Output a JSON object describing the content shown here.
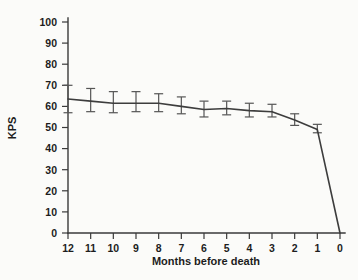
{
  "chart_data": {
    "type": "line",
    "title": "",
    "xlabel": "Months before death",
    "ylabel": "KPS",
    "xlim": [
      12,
      0
    ],
    "ylim": [
      0,
      100
    ],
    "grid": false,
    "legend": "none",
    "x_invert": true,
    "x_tick_labels": [
      "12",
      "11",
      "10",
      "9",
      "8",
      "7",
      "6",
      "5",
      "4",
      "3",
      "2",
      "1",
      "0"
    ],
    "y_tick_labels": [
      "0",
      "10",
      "20",
      "30",
      "40",
      "50",
      "60",
      "70",
      "80",
      "90",
      "100"
    ],
    "x": [
      12,
      11,
      10,
      9,
      8,
      7,
      6,
      5,
      4,
      3,
      2,
      1,
      0
    ],
    "values": [
      63.5,
      62.5,
      61.5,
      61.5,
      61.5,
      60.0,
      58.5,
      59.0,
      58.0,
      57.5,
      53.5,
      49.0,
      0.0
    ],
    "error_low": [
      57.0,
      57.5,
      57.0,
      57.5,
      57.5,
      56.5,
      55.0,
      56.0,
      55.0,
      55.0,
      51.0,
      47.5,
      null
    ],
    "error_high": [
      70.0,
      68.5,
      67.0,
      67.0,
      66.0,
      64.5,
      62.5,
      62.5,
      61.5,
      61.0,
      56.5,
      51.5,
      null
    ],
    "series": [
      {
        "name": "Mean KPS",
        "values": [
          63.5,
          62.5,
          61.5,
          61.5,
          61.5,
          60.0,
          58.5,
          59.0,
          58.0,
          57.5,
          53.5,
          49.0,
          0.0
        ]
      }
    ],
    "colors": {
      "line": "#3d3d3d",
      "error_bar": "#555555",
      "axis": "#3a3a3a",
      "text": "#1d1d1d",
      "background": "#fbfbf9"
    }
  }
}
